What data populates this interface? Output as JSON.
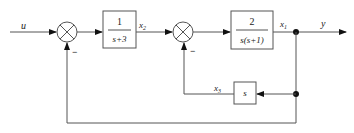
{
  "diagram": {
    "type": "control-system-block-diagram",
    "signals": {
      "input": "u",
      "x2": "x",
      "x2_sub": "2",
      "x1": "x",
      "x1_sub": "1",
      "output": "y",
      "x3": "x",
      "x3_sub": "3"
    },
    "blocks": [
      {
        "id": "G1",
        "numerator": "1",
        "denominator": "s+3"
      },
      {
        "id": "G2",
        "numerator": "2",
        "denominator": "s(s+1)"
      },
      {
        "id": "H1",
        "label": "s"
      }
    ],
    "summing_junctions": [
      {
        "id": "sum1",
        "feedback_sign": "−"
      },
      {
        "id": "sum2",
        "feedback_sign": "−"
      }
    ],
    "colors": {
      "line": "#555555",
      "text": "#222222",
      "background": "#ffffff"
    }
  }
}
